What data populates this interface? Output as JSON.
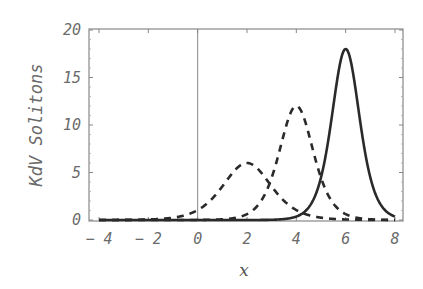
{
  "chart_data": {
    "type": "line",
    "title": "",
    "xlabel": "x",
    "ylabel": "KdV Solitons",
    "xlim": [
      -4.3,
      8.2
    ],
    "ylim": [
      0,
      20
    ],
    "x_ticks": [
      -4,
      -2,
      0,
      2,
      4,
      6,
      8
    ],
    "x_tick_labels": [
      "-4",
      "-2",
      "0",
      "2",
      "4",
      "6",
      "8"
    ],
    "y_ticks": [
      0,
      5,
      10,
      15,
      20
    ],
    "y_tick_labels": [
      "0",
      "5",
      "10",
      "15",
      "20"
    ],
    "grid": false,
    "legend": null,
    "vertical_line_at_x": 0,
    "series": [
      {
        "name": "soliton (small, dashed)",
        "style": "dashed",
        "form": "A*sech^2(k*(x-x0))",
        "amplitude": 6,
        "center": 2,
        "k": 0.76,
        "x": [
          -4,
          -2,
          -1,
          0,
          1,
          1.5,
          2,
          2.5,
          3,
          4,
          5,
          6,
          8
        ],
        "values": [
          0.0,
          0.1,
          0.4,
          1.2,
          3.4,
          4.9,
          6.0,
          4.9,
          3.4,
          1.2,
          0.4,
          0.1,
          0.0
        ]
      },
      {
        "name": "soliton (medium, dashed)",
        "style": "dashed",
        "form": "A*sech^2(k*(x-x0))",
        "amplitude": 12,
        "center": 4,
        "k": 1.08,
        "x": [
          -4,
          0,
          1,
          2,
          3,
          3.5,
          4,
          4.5,
          5,
          6,
          7,
          8
        ],
        "values": [
          0.0,
          0.0,
          0.2,
          1.1,
          5.0,
          9.1,
          12.0,
          9.1,
          5.0,
          1.1,
          0.2,
          0.0
        ]
      },
      {
        "name": "soliton (large, solid)",
        "style": "solid",
        "form": "A*sech^2(k*(x-x0))",
        "amplitude": 18,
        "center": 6,
        "k": 1.32,
        "x": [
          -4,
          2,
          3,
          4,
          5,
          5.5,
          6,
          6.5,
          7,
          8
        ],
        "values": [
          0.0,
          0.0,
          0.1,
          1.0,
          4.7,
          11.3,
          18.0,
          11.3,
          4.7,
          1.0
        ]
      }
    ]
  }
}
